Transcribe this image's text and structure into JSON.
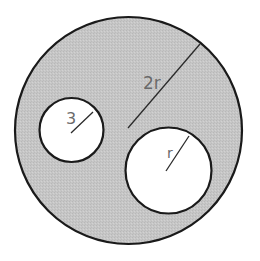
{
  "diagram": {
    "colors": {
      "background": "#ffffff",
      "shaded_region": "#c6c6c6",
      "hole_fill": "#ffffff",
      "outline": "#1a1a1a",
      "radius_line": "#2a2a2a",
      "label_text": "#6a6a6a"
    },
    "large_circle": {
      "cx": 128.5,
      "cy": 130.5,
      "r": 113.5,
      "radius_label": "2r",
      "radius_line": {
        "x1": 128,
        "y1": 128,
        "x2": 200,
        "y2": 44
      },
      "label_pos": {
        "x": 143,
        "y": 89
      }
    },
    "small_circle": {
      "cx": 71.5,
      "cy": 130,
      "r": 32,
      "radius_label": "3",
      "radius_line": {
        "x1": 71,
        "y1": 133,
        "x2": 93,
        "y2": 112
      },
      "label_pos": {
        "x": 66,
        "y": 124
      }
    },
    "medium_circle": {
      "cx": 168.5,
      "cy": 170.5,
      "r": 43,
      "radius_label": "r",
      "radius_line": {
        "x1": 166,
        "y1": 171,
        "x2": 189,
        "y2": 136
      },
      "label_pos": {
        "x": 167,
        "y": 158
      }
    }
  }
}
